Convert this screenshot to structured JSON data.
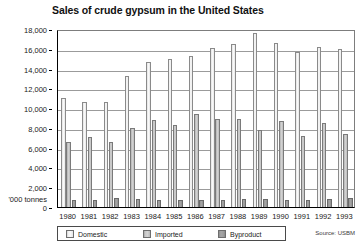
{
  "chart_data": {
    "type": "bar",
    "title": "Sales of crude gypsum in the United States",
    "xlabel": "",
    "ylabel": "'000 tonnes",
    "ylim": [
      0,
      18000
    ],
    "ytick_step": 2000,
    "yticks": [
      "0",
      "2,000",
      "4,000",
      "6,000",
      "8,000",
      "10,000",
      "12,000",
      "14,000",
      "16,000",
      "18,000"
    ],
    "grid": true,
    "legend_position": "bottom",
    "categories": [
      "1980",
      "1981",
      "1982",
      "1983",
      "1984",
      "1985",
      "1986",
      "1987",
      "1988",
      "1989",
      "1990",
      "1991",
      "1992",
      "1993"
    ],
    "series": [
      {
        "name": "Domestic",
        "color": "#f2f2f2",
        "values": [
          11000,
          10600,
          10600,
          13200,
          14700,
          15000,
          15300,
          16100,
          16500,
          17600,
          16600,
          15700,
          16200,
          16000
        ]
      },
      {
        "name": "Imported",
        "color": "#cccccc",
        "values": [
          6600,
          7100,
          6600,
          8000,
          8800,
          8300,
          9400,
          8900,
          8900,
          7800,
          8700,
          7200,
          8500,
          7400
        ]
      },
      {
        "name": "Byproduct",
        "color": "#a0a0a0",
        "values": [
          700,
          750,
          950,
          800,
          700,
          700,
          700,
          700,
          800,
          800,
          750,
          700,
          800,
          950
        ]
      }
    ],
    "source": "Source: USBM"
  },
  "legend": {
    "items": [
      {
        "label": "Domestic"
      },
      {
        "label": "Imported"
      },
      {
        "label": "Byproduct"
      }
    ]
  }
}
